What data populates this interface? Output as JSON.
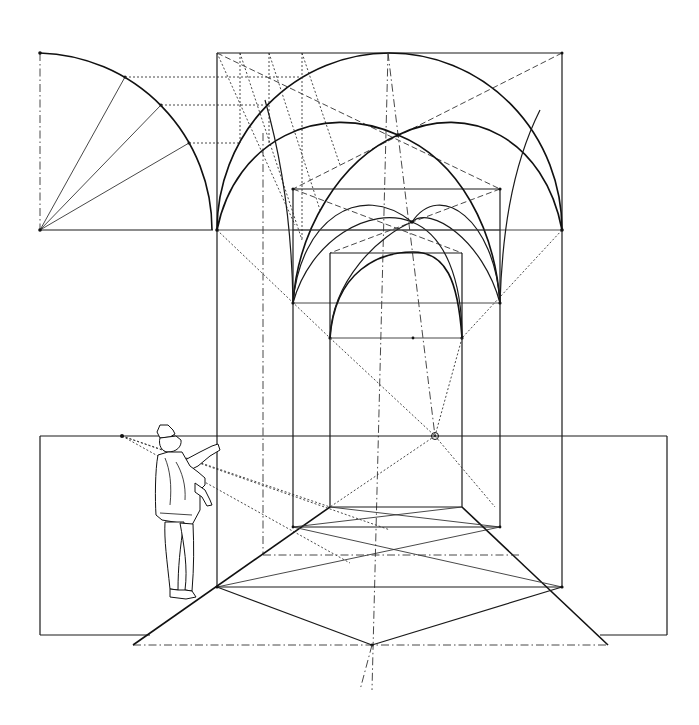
{
  "diagram": {
    "title": "",
    "colors": {
      "ink": "#1a1a1a",
      "background": "#ffffff"
    },
    "labels": [],
    "elements": {
      "profile_quadrant": {
        "center": [
          40,
          230
        ],
        "radius": 177,
        "division_rays": 3
      },
      "outer_frame": {
        "left": 217,
        "right": 562,
        "top": 53,
        "springline": 230,
        "floor": 587
      },
      "middle_frame": {
        "left": 293,
        "right": 500,
        "top": 189,
        "springline": 303,
        "floor": 527
      },
      "inner_frame": {
        "left": 330,
        "right": 462,
        "top": 212,
        "springline": 338,
        "floor": 507
      },
      "vanishing_point": [
        435,
        436
      ],
      "horizon_y": 436,
      "picture_plane_box_left": {
        "x": 40,
        "y": 436,
        "w": 177,
        "h": 199
      },
      "picture_plane_box_right": {
        "x": 562,
        "y": 436,
        "w": 105,
        "h": 199
      },
      "ground_line": {
        "y": 645,
        "x1": 133,
        "x2": 608
      },
      "observer": {
        "eye_point": [
          122,
          436
        ],
        "position": "left of outer frame"
      }
    }
  }
}
